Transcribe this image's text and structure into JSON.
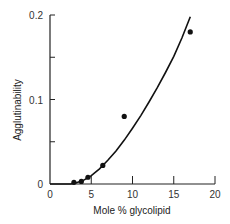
{
  "chart_data": {
    "type": "scatter",
    "title": "",
    "xlabel": "Mole % glycolipid",
    "ylabel": "Agglutinability",
    "xlim": [
      0,
      20
    ],
    "ylim": [
      0,
      0.2
    ],
    "xticks": [
      0,
      5,
      10,
      15,
      20
    ],
    "xtick_labels": [
      "0",
      "5",
      "10",
      "15",
      "20"
    ],
    "yticks": [
      0,
      0.05,
      0.1,
      0.15,
      0.2
    ],
    "ytick_labels": [
      "0",
      "",
      "0.1",
      "",
      "0.2"
    ],
    "grid": false,
    "legend": null,
    "series": [
      {
        "name": "measured",
        "kind": "points",
        "x": [
          2.9,
          3.8,
          4.6,
          6.4,
          9.0,
          17.0
        ],
        "y": [
          0.002,
          0.003,
          0.008,
          0.022,
          0.08,
          0.18
        ]
      },
      {
        "name": "fit curve",
        "kind": "line",
        "x": [
          0,
          2.5,
          3,
          4,
          5,
          6,
          7,
          8,
          9,
          10,
          11,
          12,
          13,
          14,
          15,
          16,
          17
        ],
        "y": [
          0,
          0,
          0.001,
          0.004,
          0.01,
          0.018,
          0.028,
          0.039,
          0.052,
          0.066,
          0.081,
          0.097,
          0.114,
          0.132,
          0.151,
          0.173,
          0.198
        ]
      }
    ]
  }
}
